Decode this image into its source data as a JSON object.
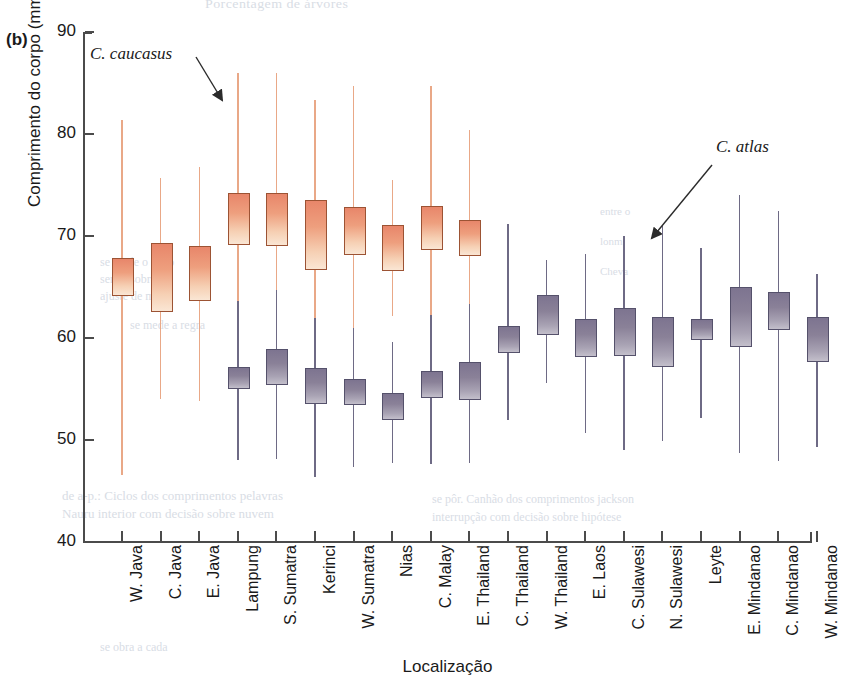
{
  "figure": {
    "panel_label": "(b)",
    "top_caption_partial": "Porcentagem de árvores"
  },
  "annotations": [
    {
      "id": "caucasus",
      "text": "C. caucasus"
    },
    {
      "id": "atlas",
      "text": "C. atlas"
    }
  ],
  "bleed_text": [
    "Porcentagem de árvores",
    "de a-p.: Ciclos dos comprimentos  pelavras",
    "Nauru interior com decisão sobre nuvem",
    "se pôr. Canhão dos comprimentos  jackson",
    "interrupção com decisão sobre hipótese",
    "se mede o ciclo",
    "ser se sobre",
    "ajuste de mais",
    "entre o",
    "lonm",
    "Cheva",
    "se mede a  regra",
    "se obra a cada"
  ],
  "chart_data": {
    "type": "box",
    "title": "",
    "xlabel": "Localização",
    "ylabel": "Comprimento do corpo (mm)",
    "ylim": [
      40,
      90
    ],
    "yticks": [
      40,
      50,
      60,
      70,
      80,
      90
    ],
    "grid": false,
    "legend_position": "annotated-arrows",
    "colors": {
      "caucasus": "#e8866a",
      "atlas": "#7d7490"
    },
    "categories": [
      "W. Java",
      "C. Java",
      "E. Java",
      "Lampung",
      "S. Sumatra",
      "Kerinci",
      "W. Sumatra",
      "Nias",
      "C. Malay",
      "E. Thailand",
      "C. Thailand",
      "W. Thailand",
      "E. Laos",
      "C. Sulawesi",
      "N. Sulawesi",
      "Leyte",
      "E. Mindanao",
      "C. Mindanao",
      "W. Mindanao"
    ],
    "series": [
      {
        "name": "C. caucasus",
        "color": "#e8866a",
        "boxes": [
          {
            "category": "W. Java",
            "low": 46.6,
            "q1": 64.3,
            "q3": 67.8,
            "high": 81.4
          },
          {
            "category": "C. Java",
            "low": 54.0,
            "q1": 62.7,
            "q3": 69.3,
            "high": 75.7
          },
          {
            "category": "E. Java",
            "low": 53.8,
            "q1": 63.8,
            "q3": 69.0,
            "high": 76.8
          },
          {
            "category": "Lampung",
            "low": 60.0,
            "q1": 69.3,
            "q3": 74.2,
            "high": 86.0
          },
          {
            "category": "S. Sumatra",
            "low": 59.8,
            "q1": 69.2,
            "q3": 74.2,
            "high": 86.0
          },
          {
            "category": "Kerinci",
            "low": 58.0,
            "q1": 66.9,
            "q3": 73.5,
            "high": 83.3
          },
          {
            "category": "W. Sumatra",
            "low": 58.5,
            "q1": 68.3,
            "q3": 72.8,
            "high": 84.7
          },
          {
            "category": "Nias",
            "low": 62.2,
            "q1": 66.8,
            "q3": 71.1,
            "high": 75.5
          },
          {
            "category": "C. Malay",
            "low": 58.3,
            "q1": 68.8,
            "q3": 72.9,
            "high": 84.7
          },
          {
            "category": "E. Thailand",
            "low": 59.0,
            "q1": 68.2,
            "q3": 71.6,
            "high": 80.4
          }
        ]
      },
      {
        "name": "C. atlas",
        "color": "#7d7490",
        "boxes": [
          {
            "category": "Lampung",
            "low": 48.0,
            "q1": 55.2,
            "q3": 57.2,
            "high": 63.6
          },
          {
            "category": "S. Sumatra",
            "low": 48.1,
            "q1": 55.6,
            "q3": 58.9,
            "high": 64.7
          },
          {
            "category": "Kerinci",
            "low": 46.4,
            "q1": 53.7,
            "q3": 57.1,
            "high": 62.0
          },
          {
            "category": "W. Sumatra",
            "low": 47.4,
            "q1": 53.6,
            "q3": 56.0,
            "high": 61.0
          },
          {
            "category": "Nias",
            "low": 47.7,
            "q1": 52.2,
            "q3": 54.6,
            "high": 59.6
          },
          {
            "category": "C. Malay",
            "low": 47.6,
            "q1": 54.3,
            "q3": 56.8,
            "high": 62.3
          },
          {
            "category": "E. Thailand",
            "low": 47.7,
            "q1": 54.1,
            "q3": 57.6,
            "high": 63.3
          },
          {
            "category": "C. Thailand",
            "low": 52.0,
            "q1": 58.7,
            "q3": 61.2,
            "high": 71.2
          },
          {
            "category": "W. Thailand",
            "low": 55.6,
            "q1": 60.5,
            "q3": 64.2,
            "high": 67.6
          },
          {
            "category": "E. Laos",
            "low": 50.7,
            "q1": 58.3,
            "q3": 61.9,
            "high": 68.2
          },
          {
            "category": "C. Sulawesi",
            "low": 49.0,
            "q1": 58.4,
            "q3": 62.9,
            "high": 70.0
          },
          {
            "category": "N. Sulawesi",
            "low": 49.9,
            "q1": 57.4,
            "q3": 62.1,
            "high": 71.1
          },
          {
            "category": "Leyte",
            "low": 52.2,
            "q1": 60.0,
            "q3": 61.9,
            "high": 68.8
          },
          {
            "category": "E. Mindanao",
            "low": 48.7,
            "q1": 59.3,
            "q3": 65.0,
            "high": 74.0
          },
          {
            "category": "C. Mindanao",
            "low": 47.9,
            "q1": 61.0,
            "q3": 64.5,
            "high": 72.5
          },
          {
            "category": "W. Mindanao",
            "low": 49.3,
            "q1": 57.8,
            "q3": 62.1,
            "high": 66.3
          }
        ]
      }
    ]
  }
}
